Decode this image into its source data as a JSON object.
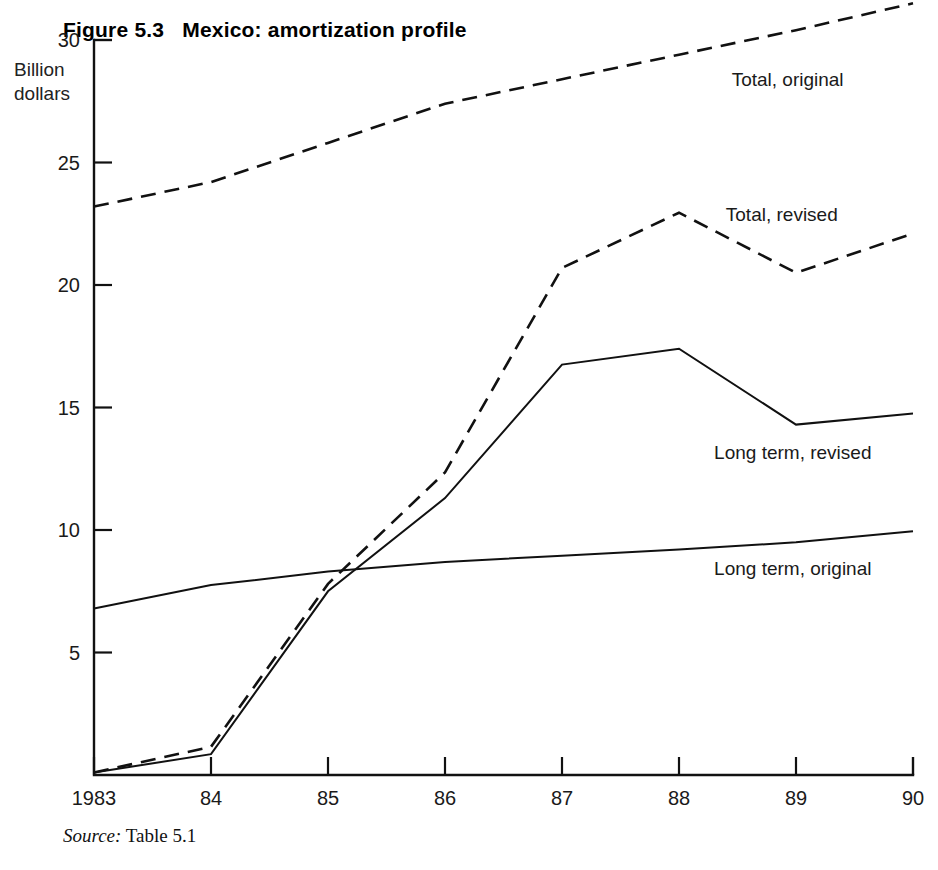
{
  "figure": {
    "number_label": "Figure 5.3",
    "title": "Mexico: amortization profile",
    "unit_label_line1": "Billion",
    "unit_label_line2": "dollars",
    "source_prefix": "Source:",
    "source_text": "Table 5.1",
    "ink_color": "#111111"
  },
  "chart_data": {
    "type": "line",
    "title": "Mexico: amortization profile",
    "subtitle": "Figure 5.3",
    "xlabel": "",
    "ylabel": "Billion dollars",
    "x": [
      "1983",
      "84",
      "85",
      "86",
      "87",
      "88",
      "89",
      "90"
    ],
    "x_tick_labels": [
      "1983",
      "84",
      "85",
      "86",
      "87",
      "88",
      "89",
      "90"
    ],
    "y_tick_labels": [
      "5",
      "10",
      "15",
      "20",
      "25",
      "30"
    ],
    "y_ticks": [
      5,
      10,
      15,
      20,
      25,
      30
    ],
    "xlim": [
      1983,
      1990
    ],
    "ylim": [
      0,
      30
    ],
    "grid": false,
    "legend": "inline-labels-right",
    "series": [
      {
        "name": "Total, original",
        "style": "dashed",
        "label_x": 1988.45,
        "label_y": 28.4,
        "values": [
          23.2,
          24.2,
          25.8,
          27.4,
          28.4,
          29.4,
          30.4,
          31.5
        ]
      },
      {
        "name": "Total, revised",
        "style": "dashed",
        "label_x": 1988.4,
        "label_y": 22.9,
        "values": [
          0.1,
          1.15,
          7.8,
          12.35,
          20.7,
          22.95,
          20.5,
          22.1
        ]
      },
      {
        "name": "Long term, revised",
        "style": "solid",
        "label_x": 1988.3,
        "label_y": 13.2,
        "values": [
          0.1,
          0.85,
          7.5,
          11.3,
          16.75,
          17.4,
          14.3,
          14.75
        ]
      },
      {
        "name": "Long term, original",
        "style": "solid",
        "label_x": 1988.3,
        "label_y": 8.45,
        "values": [
          6.8,
          7.75,
          8.3,
          8.7,
          8.95,
          9.2,
          9.5,
          9.95
        ]
      }
    ],
    "annotations": [
      "Total, original",
      "Total, revised",
      "Long term, revised",
      "Long term, original"
    ]
  },
  "geometry": {
    "plot_left": 94,
    "plot_right": 913,
    "plot_top": 40,
    "plot_bottom": 775,
    "y_top_value": 30,
    "y_bottom_value": 0
  }
}
